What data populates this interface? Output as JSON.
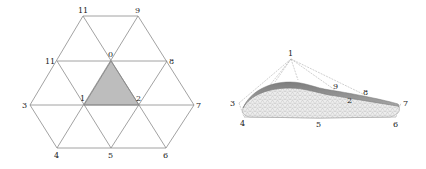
{
  "figure": {
    "left_panel": {
      "title": "",
      "type": "hexagonal triangular mesh (planar)",
      "vertices": [
        {
          "id": "0",
          "label": "0",
          "x": 111,
          "y": 61
        },
        {
          "id": "1",
          "label": "1",
          "x": 84,
          "y": 105
        },
        {
          "id": "2",
          "label": "2",
          "x": 139,
          "y": 105
        },
        {
          "id": "3",
          "label": "3",
          "x": 30,
          "y": 105
        },
        {
          "id": "4",
          "label": "4",
          "x": 57,
          "y": 148
        },
        {
          "id": "5",
          "label": "5",
          "x": 111,
          "y": 148
        },
        {
          "id": "6",
          "label": "6",
          "x": 166,
          "y": 148
        },
        {
          "id": "7",
          "label": "7",
          "x": 194,
          "y": 105
        },
        {
          "id": "8",
          "label": "8",
          "x": 167,
          "y": 61
        },
        {
          "id": "9",
          "label": "9",
          "x": 138,
          "y": 16
        },
        {
          "id": "10",
          "label": "10",
          "x": 83,
          "y": 16
        },
        {
          "id": "11",
          "label": "11",
          "x": 57,
          "y": 61
        }
      ],
      "shaded_triangle": [
        "0",
        "1",
        "2"
      ],
      "shaded_color": "#bdbdbd"
    },
    "right_panel": {
      "title": "",
      "type": "3D surface patch over control net",
      "labels": [
        {
          "id": "1",
          "label": "1",
          "x": 291,
          "y": 55
        },
        {
          "id": "3",
          "label": "3",
          "x": 232,
          "y": 104
        },
        {
          "id": "4",
          "label": "4",
          "x": 243,
          "y": 124
        },
        {
          "id": "5",
          "label": "5",
          "x": 319,
          "y": 125
        },
        {
          "id": "6",
          "label": "6",
          "x": 396,
          "y": 125
        },
        {
          "id": "7",
          "label": "7",
          "x": 406,
          "y": 104
        },
        {
          "id": "9",
          "label": "9",
          "x": 336,
          "y": 88
        },
        {
          "id": "8",
          "label": "8",
          "x": 366,
          "y": 94
        },
        {
          "id": "2",
          "label": "2",
          "x": 350,
          "y": 102
        }
      ],
      "apex_vertex": "1",
      "surface_color_top": "#8c8c8c",
      "surface_color_under": "#e6e6e6"
    }
  }
}
